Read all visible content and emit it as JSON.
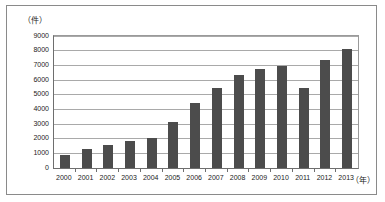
{
  "figure": {
    "y_unit_label": "（件）",
    "x_unit_label": "（年）",
    "bar_color": "#4c4c4c",
    "gridline_color": "#a9a9a9",
    "axis_color": "#6e6e6e",
    "frame_color": "#8a8a8a",
    "background": "#ffffff"
  },
  "chart_data": {
    "type": "bar",
    "title": "",
    "subtitle": "",
    "xlabel": "（年）",
    "ylabel": "（件）",
    "categories": [
      "2000",
      "2001",
      "2002",
      "2003",
      "2004",
      "2005",
      "2006",
      "2007",
      "2008",
      "2009",
      "2010",
      "2011",
      "2012",
      "2013"
    ],
    "values": [
      900,
      1300,
      1570,
      1840,
      2060,
      3130,
      4440,
      5480,
      6350,
      6730,
      6960,
      5430,
      7370,
      8130
    ],
    "ylim": [
      0,
      9000
    ],
    "ytick_values": [
      0,
      1000,
      2000,
      3000,
      4000,
      5000,
      6000,
      7000,
      8000,
      9000
    ],
    "ytick_labels": [
      "0",
      "1000",
      "2000",
      "3000",
      "4000",
      "5000",
      "6000",
      "7000",
      "8000",
      "9000"
    ],
    "grid": true,
    "grid_axis": "y",
    "legend": false,
    "legend_position": "none",
    "series": [
      {
        "name": "件数",
        "values": [
          900,
          1300,
          1570,
          1840,
          2060,
          3130,
          4440,
          5480,
          6350,
          6730,
          6960,
          5430,
          7370,
          8130
        ]
      }
    ]
  }
}
